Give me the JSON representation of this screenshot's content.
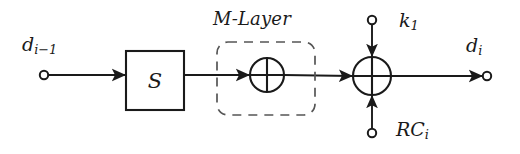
{
  "figure": {
    "type": "block-diagram",
    "title_text": "",
    "background_color": "#ffffff",
    "stroke_color": "#1a1a1a",
    "dashed_stroke_color": "#555555",
    "width": 520,
    "height": 154
  },
  "labels": {
    "input": {
      "base": "d",
      "sub": "i−1",
      "text": "d",
      "subscript": "i−1"
    },
    "m_layer": {
      "text": "M-Layer"
    },
    "s_box": {
      "text": "S"
    },
    "key": {
      "base": "k",
      "sub": "1",
      "text": "k",
      "subscript": "1"
    },
    "round_constant": {
      "base": "RC",
      "sub": "i",
      "text": "RC",
      "subscript": "i"
    },
    "output": {
      "base": "d",
      "sub": "i",
      "text": "d",
      "subscript": "i"
    }
  },
  "nodes": [
    {
      "name": "input-terminal",
      "shape": "open-circle",
      "cx": 44,
      "cy": 75,
      "r": 4
    },
    {
      "name": "s-box",
      "shape": "rectangle",
      "x": 126,
      "y": 51,
      "w": 58,
      "h": 59,
      "label": "S"
    },
    {
      "name": "m-layer-dashed-box",
      "shape": "rounded-rect-dashed",
      "x": 217,
      "y": 42,
      "w": 98,
      "h": 73,
      "rx": 10
    },
    {
      "name": "xor-m-layer",
      "shape": "xor-circle",
      "cx": 267,
      "cy": 75,
      "r": 17
    },
    {
      "name": "xor-key-addition",
      "shape": "xor-circle",
      "cx": 372,
      "cy": 76,
      "r": 19
    },
    {
      "name": "key-terminal",
      "shape": "open-circle",
      "cx": 372,
      "cy": 20,
      "r": 4
    },
    {
      "name": "round-constant-terminal",
      "shape": "open-circle",
      "cx": 372,
      "cy": 133,
      "r": 4
    },
    {
      "name": "output-terminal",
      "shape": "open-circle",
      "cx": 487,
      "cy": 76,
      "r": 4
    }
  ],
  "edges": [
    {
      "name": "edge-input-to-sbox",
      "from": "input-terminal",
      "to": "s-box",
      "direction": "right",
      "arrow": true
    },
    {
      "name": "edge-sbox-to-xor-m",
      "from": "s-box",
      "to": "xor-m-layer",
      "direction": "right",
      "arrow": true
    },
    {
      "name": "edge-xor-m-to-xor-key",
      "from": "xor-m-layer",
      "to": "xor-key-addition",
      "direction": "right",
      "arrow": true
    },
    {
      "name": "edge-key-to-xor",
      "from": "key-terminal",
      "to": "xor-key-addition",
      "direction": "down",
      "arrow": true
    },
    {
      "name": "edge-round-constant-to-xor",
      "from": "round-constant-terminal",
      "to": "xor-key-addition",
      "direction": "up",
      "arrow": true
    },
    {
      "name": "edge-xor-key-to-output",
      "from": "xor-key-addition",
      "to": "output-terminal",
      "direction": "right",
      "arrow": true
    }
  ]
}
